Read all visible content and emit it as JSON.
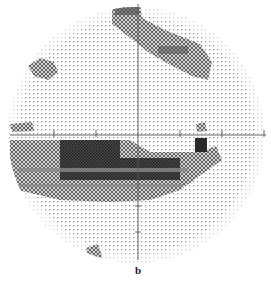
{
  "figure": {
    "panel_label": "b",
    "type": "visual-field-grayscale-plot",
    "center": [
      136,
      132
    ],
    "radius": 127,
    "colors": {
      "background": "#ffffff",
      "light_dots": "#9a9a9a",
      "medium_defect": "#6e6e6e",
      "dense_defect": "#2a2a2a",
      "axis": "#555555"
    },
    "defects": [
      {
        "name": "superior-nasal-step",
        "shape": "band",
        "points": [
          [
            112,
            4
          ],
          [
            140,
            4
          ],
          [
            140,
            20
          ],
          [
            200,
            45
          ],
          [
            215,
            65
          ],
          [
            200,
            80
          ],
          [
            150,
            55
          ],
          [
            112,
            25
          ]
        ],
        "density": "medium"
      },
      {
        "name": "temporal-island",
        "shape": "blob",
        "points": [
          [
            28,
            62
          ],
          [
            48,
            58
          ],
          [
            58,
            70
          ],
          [
            45,
            80
          ],
          [
            30,
            74
          ]
        ],
        "density": "medium"
      },
      {
        "name": "edge-spot-left",
        "shape": "blob",
        "points": [
          [
            10,
            124
          ],
          [
            35,
            122
          ],
          [
            33,
            132
          ],
          [
            10,
            132
          ]
        ],
        "density": "medium"
      },
      {
        "name": "edge-spot-right",
        "shape": "blob",
        "points": [
          [
            196,
            124
          ],
          [
            206,
            124
          ],
          [
            206,
            132
          ],
          [
            196,
            132
          ]
        ],
        "density": "medium"
      },
      {
        "name": "inferior-arcuate-dense",
        "shape": "band",
        "points": [
          [
            10,
            140
          ],
          [
            120,
            140
          ],
          [
            120,
            158
          ],
          [
            200,
            158
          ],
          [
            210,
            145
          ],
          [
            218,
            150
          ],
          [
            210,
            170
          ],
          [
            170,
            182
          ],
          [
            140,
            188
          ],
          [
            20,
            190
          ],
          [
            10,
            170
          ]
        ],
        "density": "dense"
      },
      {
        "name": "inferior-arcuate-fringe",
        "shape": "band",
        "points": [
          [
            18,
            186
          ],
          [
            140,
            186
          ],
          [
            150,
            196
          ],
          [
            100,
            200
          ],
          [
            40,
            198
          ]
        ],
        "density": "medium"
      },
      {
        "name": "lower-spot",
        "shape": "blob",
        "points": [
          [
            85,
            246
          ],
          [
            100,
            244
          ],
          [
            102,
            262
          ],
          [
            90,
            262
          ]
        ],
        "density": "medium"
      }
    ],
    "axis": {
      "horizontal_y": 133,
      "vertical_x": 138,
      "tick_positions_x": [
        54,
        96,
        180,
        222
      ]
    }
  }
}
